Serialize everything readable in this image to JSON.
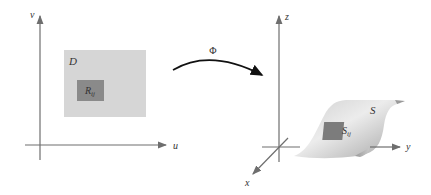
{
  "left_panel": {
    "axis_u_label": "u",
    "axis_v_label": "v",
    "region_label": "D",
    "subregion_label": "R",
    "subregion_subscript": "ij"
  },
  "mapping": {
    "label": "Φ"
  },
  "right_panel": {
    "axis_x_label": "x",
    "axis_y_label": "y",
    "axis_z_label": "z",
    "surface_label": "S",
    "patch_label": "S",
    "patch_subscript": "ij"
  },
  "colors": {
    "axis": "#6e6e6e",
    "region_fill": "#d6d6d6",
    "subregion_fill": "#8a8a8a",
    "arrow": "#111111",
    "surface_light": "#e4e4e4",
    "surface_dark": "#b0b0b0",
    "patch_fill": "#7c7c7c"
  }
}
